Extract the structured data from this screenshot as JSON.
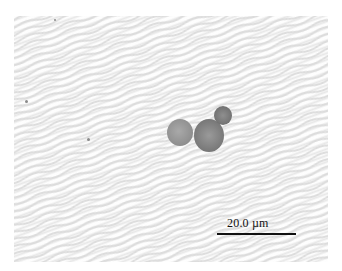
{
  "image": {
    "description": "Light micrograph of a cluster of three round cells on a wavy-patterned background",
    "background_color": "#f1f1f1",
    "cell_color": "#8a8a8a"
  },
  "scale_bar": {
    "label": "20.0 µm",
    "color": "#111111"
  }
}
